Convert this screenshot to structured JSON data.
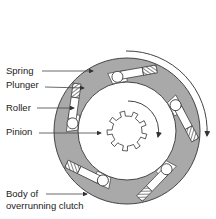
{
  "diagram": {
    "title": "Overrunning clutch",
    "labels": {
      "spring": "Spring",
      "plunger": "Plunger",
      "roller": "Roller",
      "pinion": "Pinion",
      "body_line1": "Body of",
      "body_line2": "overrunning clutch"
    },
    "components": {
      "roller_assemblies": 5,
      "pinion_teeth": 9
    },
    "colors": {
      "body": "#a9a9a9",
      "outline": "#333333",
      "white": "#ffffff"
    }
  }
}
